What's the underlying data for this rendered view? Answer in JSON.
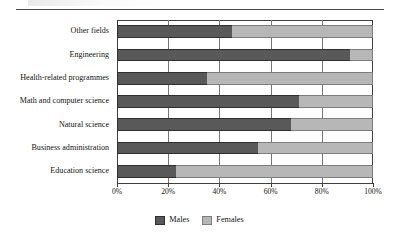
{
  "figure": {
    "top_rule": true
  },
  "legend": {
    "position": "bottom-center",
    "items": [
      {
        "label": "Males",
        "color": "#595959"
      },
      {
        "label": "Females",
        "color": "#b7b7b7"
      }
    ]
  },
  "axis": {
    "tick_labels": [
      "0%",
      "20%",
      "40%",
      "60%",
      "80%",
      "100%"
    ],
    "tick_values": [
      0,
      20,
      40,
      60,
      80,
      100
    ]
  },
  "chart_data": {
    "type": "bar",
    "orientation": "horizontal",
    "stacked": "percent",
    "title": "",
    "subtitle": "",
    "xlabel": "",
    "ylabel": "",
    "xlim": [
      0,
      100
    ],
    "grid": true,
    "grid_axis": "x",
    "legend_position": "bottom-center",
    "categories": [
      "Other fields",
      "Engineering",
      "Health-related programmes",
      "Math and computer science",
      "Natural science",
      "Business administration",
      "Education science"
    ],
    "series": [
      {
        "name": "Males",
        "color": "#595959",
        "values": [
          45,
          91,
          35,
          71,
          68,
          55,
          23
        ]
      },
      {
        "name": "Females",
        "color": "#b7b7b7",
        "values": [
          55,
          9,
          65,
          29,
          32,
          45,
          77
        ]
      }
    ],
    "tick_labels": [
      "0%",
      "20%",
      "40%",
      "60%",
      "80%",
      "100%"
    ],
    "units": "percent"
  }
}
